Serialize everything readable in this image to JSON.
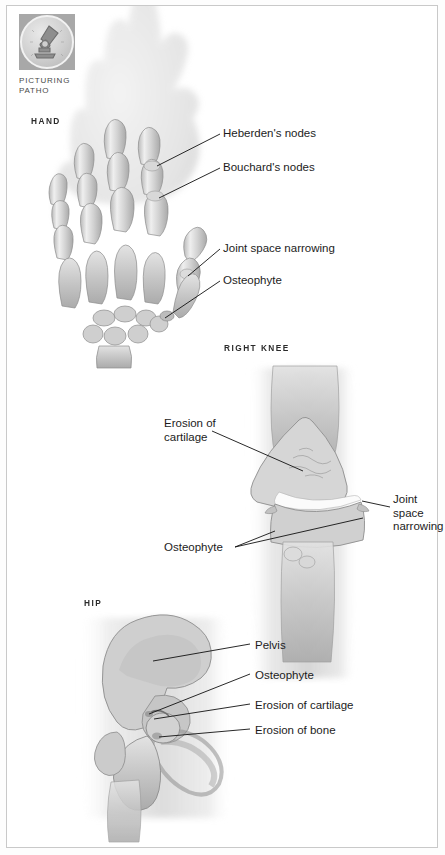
{
  "page": {
    "background": "#ffffff",
    "border_color": "#c9c9c9"
  },
  "logo": {
    "icon": "microscope-icon",
    "caption_line1": "PICTURING",
    "caption_line2": "PATHO",
    "box_color": "#a8a8a8",
    "disc_color": "#d5d5d5"
  },
  "sections": [
    {
      "id": "hand",
      "heading": "HAND",
      "illustration": "hand-xray-illustration",
      "labels": [
        {
          "name": "heberdens-nodes",
          "text": "Heberden's nodes"
        },
        {
          "name": "bouchards-nodes",
          "text": "Bouchard's nodes"
        },
        {
          "name": "joint-space-narrowing",
          "text": "Joint space narrowing"
        },
        {
          "name": "osteophyte",
          "text": "Osteophyte"
        }
      ]
    },
    {
      "id": "knee",
      "heading": "RIGHT KNEE",
      "illustration": "knee-xray-illustration",
      "labels": [
        {
          "name": "erosion-of-cartilage",
          "text": "Erosion of\ncartilage"
        },
        {
          "name": "joint-space-narrowing",
          "text": "Joint\nspace\nnarrowing"
        },
        {
          "name": "osteophyte",
          "text": "Osteophyte"
        }
      ]
    },
    {
      "id": "hip",
      "heading": "HIP",
      "illustration": "hip-xray-illustration",
      "labels": [
        {
          "name": "pelvis",
          "text": "Pelvis"
        },
        {
          "name": "osteophyte",
          "text": "Osteophyte"
        },
        {
          "name": "erosion-of-cartilage",
          "text": "Erosion of cartilage"
        },
        {
          "name": "erosion-of-bone",
          "text": "Erosion of bone"
        }
      ]
    }
  ]
}
